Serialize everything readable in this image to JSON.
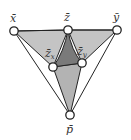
{
  "diagram": {
    "colors": {
      "background": "#ffffff",
      "light_fill": "#c2c2c2",
      "mid_fill": "#b5b5b5",
      "dark_fill": "#7a7a7a",
      "stroke": "#222222",
      "node_fill": "#ffffff"
    },
    "nodes": {
      "x": {
        "label": "x̄",
        "cx": 14,
        "cy": 31
      },
      "z": {
        "label": "z̄",
        "cx": 68,
        "cy": 30
      },
      "y": {
        "label": "ȳ",
        "cx": 117,
        "cy": 30
      },
      "zx": {
        "label": "z̄",
        "sub": "x",
        "cx": 53,
        "cy": 67
      },
      "zy": {
        "label": "z̄",
        "sub": "y",
        "cx": 82,
        "cy": 63
      },
      "p": {
        "label": "p̄",
        "cx": 70,
        "cy": 115
      }
    },
    "edges": [
      [
        "x",
        "z"
      ],
      [
        "z",
        "y"
      ],
      [
        "x",
        "zx"
      ],
      [
        "y",
        "zy"
      ],
      [
        "x",
        "p"
      ],
      [
        "y",
        "p"
      ],
      [
        "zx",
        "zy"
      ],
      [
        "zx",
        "p"
      ],
      [
        "zy",
        "p"
      ],
      [
        "z",
        "zx"
      ],
      [
        "z",
        "zy"
      ]
    ],
    "regions": [
      {
        "name": "left-upper-triangle",
        "vertices": [
          "x",
          "z",
          "zx"
        ],
        "shade": "light"
      },
      {
        "name": "right-upper-triangle",
        "vertices": [
          "z",
          "y",
          "zy"
        ],
        "shade": "light"
      },
      {
        "name": "central-curved-triangle",
        "vertices": [
          "z",
          "zx",
          "zy"
        ],
        "shade": "dark"
      },
      {
        "name": "lower-triangle",
        "vertices": [
          "zx",
          "zy",
          "p"
        ],
        "shade": "mid"
      }
    ]
  }
}
